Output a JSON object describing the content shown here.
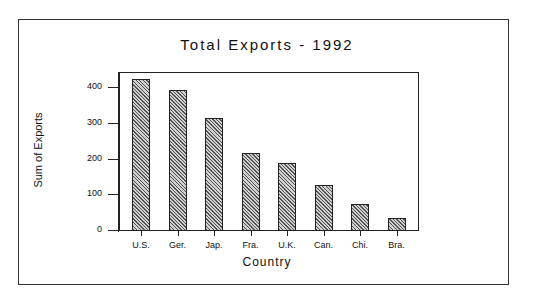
{
  "chart_data": {
    "type": "bar",
    "title": "Total Exports - 1992",
    "xlabel": "Country",
    "ylabel": "Sum of Exports",
    "categories": [
      "U.S.",
      "Ger.",
      "Jap.",
      "Fra.",
      "U.K.",
      "Can.",
      "Chi.",
      "Bra."
    ],
    "values": [
      423,
      392,
      314,
      216,
      188,
      126,
      73,
      34
    ],
    "ylim": [
      0,
      440
    ],
    "yticks": [
      0,
      100,
      200,
      300,
      400
    ],
    "grid": false,
    "legend": null,
    "bar_fill": "diagonal-hatch",
    "colors": {
      "bar_fill": "#9a9a9a",
      "bar_edge": "#222222",
      "background": "#ffffff"
    }
  }
}
